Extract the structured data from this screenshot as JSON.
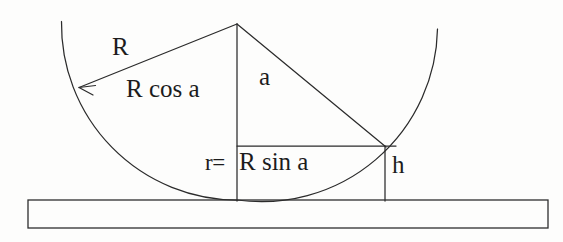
{
  "figure": {
    "background_color": "#fdfdfc",
    "ink_color": "#2b2b2b"
  },
  "labels": {
    "radius": "R",
    "radius_cos": "R cos a",
    "angle": "a",
    "r_prefix": "r=",
    "r_value": "R sin a",
    "height": "h"
  },
  "geometry": {
    "apex": {
      "x": 237,
      "y": 24
    },
    "circle_radius": 176,
    "arc_left_end": {
      "x": 62,
      "y": 22
    },
    "arc_right_end": {
      "x": 437,
      "y": 29
    },
    "arc_bottom": {
      "x": 237,
      "y": 200
    },
    "arrow_tip": {
      "x": 77,
      "y": 88
    },
    "arrow_tail": {
      "x": 237,
      "y": 24
    },
    "intersection": {
      "x": 385,
      "y": 146
    },
    "horizontal_line": {
      "x1": 237,
      "y1": 146,
      "x2": 396,
      "y2": 146
    },
    "vertical_axis": {
      "x": 237,
      "y1": 24,
      "y2": 201
    },
    "height_line": {
      "x": 385,
      "y1": 146,
      "y2": 201
    },
    "slab": {
      "x": 28,
      "y": 200,
      "width": 520,
      "height": 28
    }
  }
}
